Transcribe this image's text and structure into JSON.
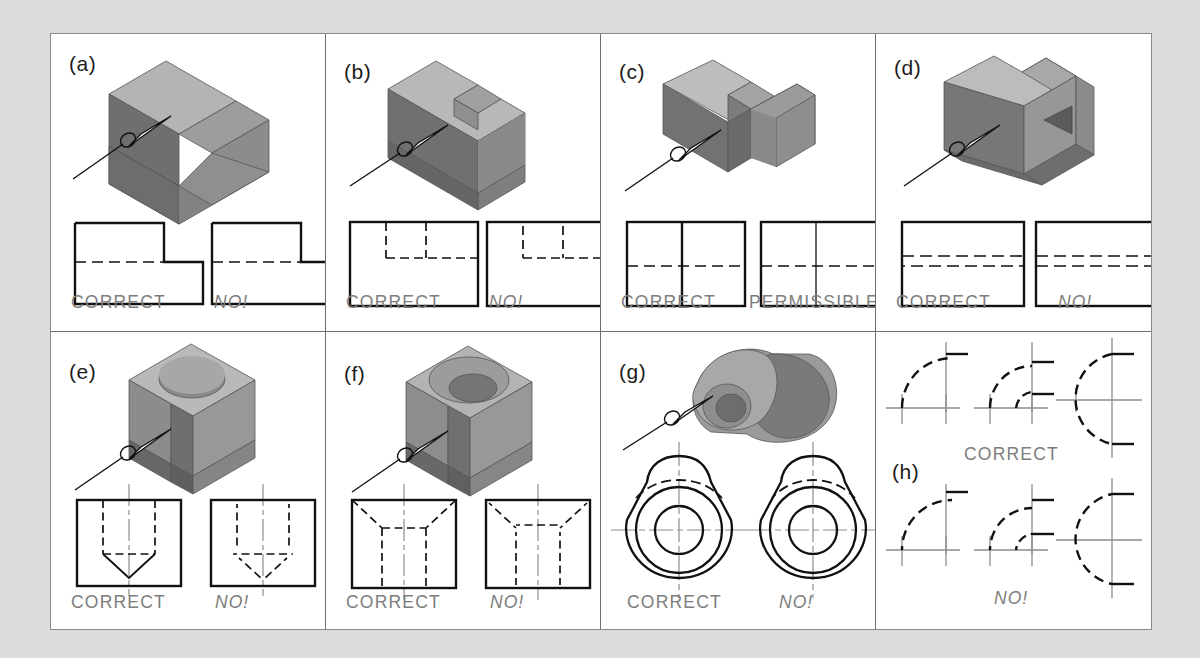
{
  "figure": {
    "background_color": "#dcdcdc",
    "sheet_color": "#ffffff",
    "border_color": "#8a8a8a",
    "label_color": "#7d7d7d",
    "line_color": "#111111",
    "centerline_color": "#8d8d8d"
  },
  "panels": [
    {
      "id": "a",
      "letter": "(a)",
      "object": "stepped-block",
      "labels": {
        "left": "CORRECT",
        "right": "NO!"
      },
      "left_label_style": "normal",
      "right_label_style": "italic"
    },
    {
      "id": "b",
      "letter": "(b)",
      "object": "slotted-notched-block",
      "labels": {
        "left": "CORRECT",
        "right": "NO!"
      },
      "left_label_style": "normal",
      "right_label_style": "italic"
    },
    {
      "id": "c",
      "letter": "(c)",
      "object": "double-rib-block",
      "labels": {
        "left": "CORRECT",
        "right": "PERMISSIBLE"
      },
      "left_label_style": "normal",
      "right_label_style": "normal"
    },
    {
      "id": "d",
      "letter": "(d)",
      "object": "block-with-triangular-recess",
      "labels": {
        "left": "CORRECT",
        "right": "NO!"
      },
      "left_label_style": "normal",
      "right_label_style": "italic"
    },
    {
      "id": "e",
      "letter": "(e)",
      "object": "cube-with-drilled-blind-hole",
      "labels": {
        "left": "CORRECT",
        "right": "NO!"
      },
      "left_label_style": "normal",
      "right_label_style": "italic"
    },
    {
      "id": "f",
      "letter": "(f)",
      "object": "cube-with-countersunk-hole",
      "labels": {
        "left": "CORRECT",
        "right": "NO!"
      },
      "left_label_style": "normal",
      "right_label_style": "italic"
    },
    {
      "id": "g",
      "letter": "(g)",
      "object": "teardrop-boss-with-bore",
      "labels": {
        "left": "CORRECT",
        "right": "NO!"
      },
      "left_label_style": "normal",
      "right_label_style": "italic"
    },
    {
      "id": "h",
      "letter": "(h)",
      "object": "hidden-arc-centerline-junctions",
      "labels": {
        "top": "CORRECT",
        "bottom": "NO!"
      },
      "top_label_style": "normal",
      "bottom_label_style": "italic"
    }
  ]
}
